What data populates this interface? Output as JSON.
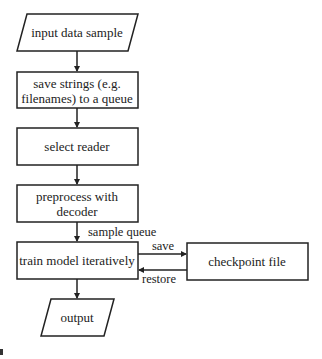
{
  "diagram": {
    "type": "flowchart",
    "nodes": [
      {
        "id": "input",
        "shape": "parallelogram",
        "lines": [
          "input data sample"
        ]
      },
      {
        "id": "save_strings",
        "shape": "rectangle",
        "lines": [
          "save strings (e.g.",
          "filenames) to a queue"
        ]
      },
      {
        "id": "select_reader",
        "shape": "rectangle",
        "lines": [
          "select reader"
        ]
      },
      {
        "id": "preprocess",
        "shape": "rectangle",
        "lines": [
          "preprocess with",
          "decoder"
        ]
      },
      {
        "id": "train",
        "shape": "rectangle",
        "lines": [
          "train model iteratively"
        ]
      },
      {
        "id": "checkpoint",
        "shape": "rectangle",
        "lines": [
          "checkpoint file"
        ]
      },
      {
        "id": "output",
        "shape": "parallelogram",
        "lines": [
          "output"
        ]
      }
    ],
    "edges": [
      {
        "from": "input",
        "to": "save_strings",
        "label": ""
      },
      {
        "from": "save_strings",
        "to": "select_reader",
        "label": ""
      },
      {
        "from": "select_reader",
        "to": "preprocess",
        "label": ""
      },
      {
        "from": "preprocess",
        "to": "train",
        "label": "sample queue"
      },
      {
        "from": "train",
        "to": "checkpoint",
        "label": "save"
      },
      {
        "from": "checkpoint",
        "to": "train",
        "label": "restore"
      },
      {
        "from": "train",
        "to": "output",
        "label": ""
      }
    ],
    "colors": {
      "stroke": "#222222",
      "background": "#ffffff",
      "text": "#222222"
    }
  }
}
